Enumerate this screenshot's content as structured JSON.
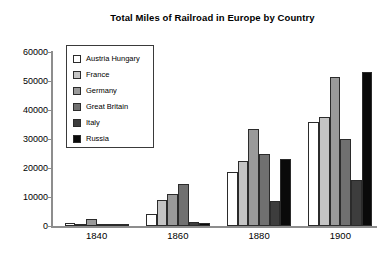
{
  "chart_data": {
    "type": "bar",
    "title": "Total Miles of Railroad in Europe by Country",
    "xlabel": "",
    "ylabel": "",
    "categories": [
      "1840",
      "1860",
      "1880",
      "1900"
    ],
    "ylim": [
      0,
      60000
    ],
    "yticks": [
      0,
      10000,
      20000,
      30000,
      40000,
      50000,
      60000
    ],
    "ytick_labels": [
      "0",
      "10000",
      "20000",
      "30000",
      "40000",
      "50000",
      "60000"
    ],
    "grid": false,
    "legend_position": "upper-left-inside",
    "series": [
      {
        "name": "Austria Hungary",
        "color": "#ffffff",
        "values": [
          900,
          4000,
          18500,
          36000
        ]
      },
      {
        "name": "France",
        "color": "#c4c4c4",
        "values": [
          300,
          9000,
          22500,
          37500
        ]
      },
      {
        "name": "Germany",
        "color": "#9a9a9a",
        "values": [
          2500,
          11000,
          33500,
          51500
        ]
      },
      {
        "name": "Great Britain",
        "color": "#707070",
        "values": [
          800,
          14500,
          25000,
          30000
        ]
      },
      {
        "name": "Italy",
        "color": "#3d3d3d",
        "values": [
          200,
          1500,
          8500,
          16000
        ]
      },
      {
        "name": "Russia",
        "color": "#0a0a0a",
        "values": [
          150,
          1000,
          23000,
          53000
        ]
      }
    ]
  },
  "legend": {
    "items": [
      {
        "label": "Austria Hungary"
      },
      {
        "label": "France"
      },
      {
        "label": "Germany"
      },
      {
        "label": "Great Britain"
      },
      {
        "label": "Italy"
      },
      {
        "label": "Russia"
      }
    ]
  }
}
